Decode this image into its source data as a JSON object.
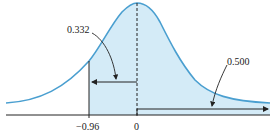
{
  "diagram": {
    "type": "normal-distribution-area",
    "colors": {
      "curve": "#4a9fd0",
      "fill": "#d4ebf7",
      "axis": "#222222",
      "arrow": "#222222",
      "background": "#ffffff"
    },
    "annotations": {
      "left_area": "0.332",
      "right_area": "0.500"
    },
    "axis_ticks": {
      "left": "−0.96",
      "center": "0"
    }
  }
}
